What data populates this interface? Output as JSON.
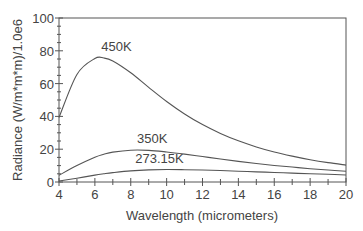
{
  "chart_data": {
    "type": "line",
    "title": "",
    "xlabel": "Wavelength (micrometers)",
    "ylabel": "Radiance (W/m*m*m)/1.0e6",
    "xlim": [
      4,
      20
    ],
    "ylim": [
      0,
      100
    ],
    "xticks": [
      4,
      6,
      8,
      10,
      12,
      14,
      16,
      18,
      20
    ],
    "yticks": [
      0,
      20,
      40,
      60,
      80,
      100
    ],
    "grid": false,
    "legend": "inline labels",
    "x": [
      4,
      5,
      6,
      6.5,
      7,
      8,
      9,
      10,
      11,
      12,
      13,
      14,
      15,
      16,
      17,
      18,
      19,
      20
    ],
    "series": [
      {
        "name": "450K",
        "label_at": [
          7.2,
          80
        ],
        "values": [
          39.3,
          65.6,
          75.3,
          75.6,
          73.8,
          66.6,
          57.7,
          49.1,
          41.5,
          35.0,
          29.6,
          25.1,
          21.4,
          18.3,
          15.8,
          13.6,
          11.8,
          10.3
        ]
      },
      {
        "name": "350K",
        "label_at": [
          9.2,
          24
        ],
        "values": [
          4.1,
          10.0,
          15.1,
          16.9,
          18.2,
          19.4,
          19.3,
          18.3,
          17.0,
          15.5,
          14.0,
          12.6,
          11.3,
          10.1,
          9.1,
          8.1,
          7.3,
          6.6
        ]
      },
      {
        "name": "273.15K",
        "label_at": [
          9.6,
          11.5
        ],
        "values": [
          0.6,
          2.3,
          4.2,
          5.0,
          5.7,
          6.8,
          7.4,
          7.6,
          7.5,
          7.3,
          7.0,
          6.6,
          6.2,
          5.8,
          5.4,
          5.0,
          4.7,
          4.3
        ]
      }
    ]
  }
}
